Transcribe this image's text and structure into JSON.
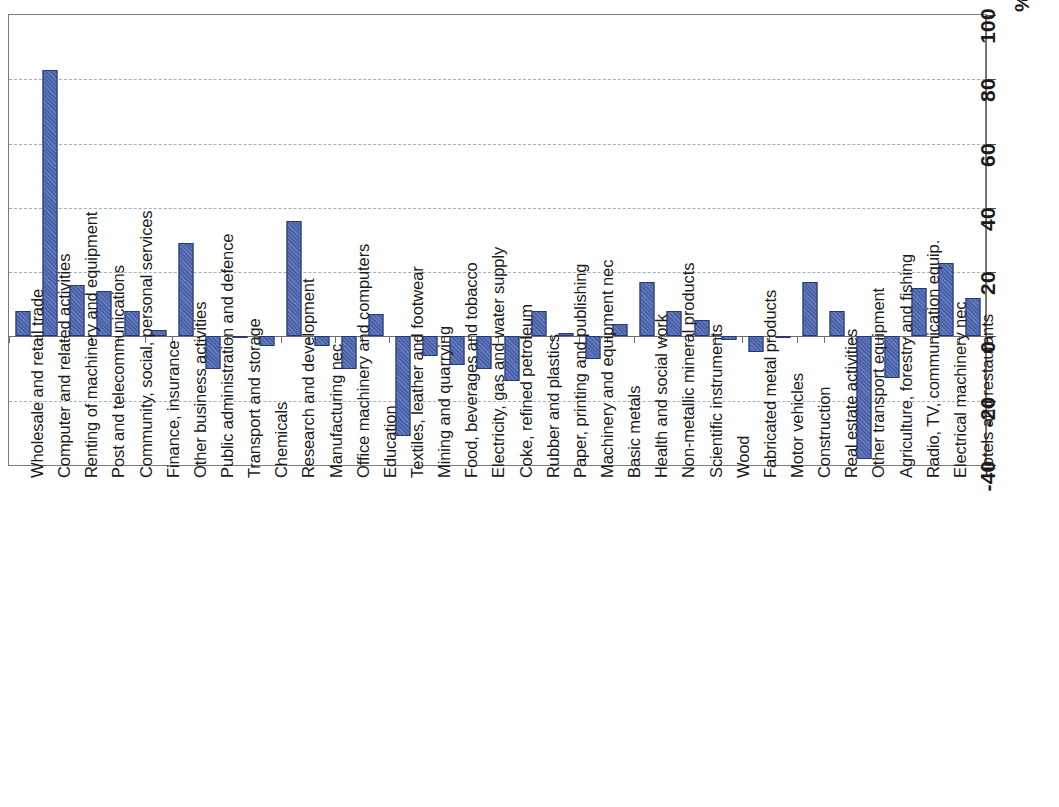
{
  "chart_data": {
    "type": "bar",
    "title": "",
    "subtitle": "",
    "xlabel": "",
    "ylabel": "%",
    "unit": "%",
    "ylim": [
      -40,
      100
    ],
    "yticks": [
      -40,
      -20,
      0,
      20,
      40,
      60,
      80,
      100
    ],
    "ytick_labels": [
      "-40",
      "-20",
      "0",
      "20",
      "40",
      "60",
      "80",
      "100"
    ],
    "grid": true,
    "gridlines_at": [
      -20,
      20,
      40,
      60,
      80
    ],
    "legend": null,
    "orientation": "vertical",
    "bar_color": "#4a63ab",
    "bar_edge_color": "#243a73",
    "categories": [
      "Wholesale and retail trade",
      "Computer and related activities",
      "Renting of machinery and equipment",
      "Post and telecommunications",
      "Community, social, personal services",
      "Finance, insurance",
      "Other business activities",
      "Public administration and defence",
      "Transport and storage",
      "Chemicals",
      "Research and development",
      "Manufacturing nec",
      "Office machinery and computers",
      "Education",
      "Textiles, leather and footwear",
      "Mining and quarrying",
      "Food, beverages and tobacco",
      "Electricity, gas and water supply",
      "Coke, refined petroleum",
      "Rubber and plastics",
      "Paper, printing and publishing",
      "Machinery and equipment nec",
      "Basic metals",
      "Health and social work",
      "Non-metallic mineral products",
      "Scientific instruments",
      "Wood",
      "Fabricated metal products",
      "Motor vehicles",
      "Construction",
      "Real estate activities",
      "Other transport equipment",
      "Agriculture, forestry and fishing",
      "Radio, TV, communication equip.",
      "Electrical machinery nec",
      "Hotels and restaurants"
    ],
    "values": [
      8,
      83,
      16,
      14,
      8,
      2,
      29,
      -10,
      0,
      -3,
      36,
      -3,
      -10,
      7,
      -31,
      -6,
      -9,
      -10,
      -14,
      8,
      1,
      -7,
      4,
      17,
      8,
      5,
      -1,
      -5,
      0,
      17,
      8,
      -38,
      -13,
      15,
      23,
      12
    ]
  }
}
